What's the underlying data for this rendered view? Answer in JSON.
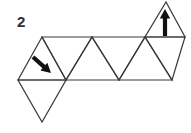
{
  "figure": {
    "label": "2",
    "kind": "triangle-net-diagram",
    "background_color": "#ffffff",
    "line_color": "#3a3a3a",
    "arrow_color": "#111111",
    "label_color": "#2f2f2f",
    "canvas": {
      "width": 191,
      "height": 133
    },
    "geometry": {
      "top_row_y": 37,
      "bottom_row_y": 80,
      "top_vertices_x": [
        42,
        92,
        145,
        185
      ],
      "bottom_vertices_x": [
        18,
        66,
        119,
        172
      ],
      "upper_tab_apex": {
        "x": 166,
        "y": 2
      },
      "lower_tab_apex": {
        "x": 42,
        "y": 122
      }
    },
    "triangles": [
      {
        "name": "strip-up-1",
        "points": "18,80 66,80 42,37"
      },
      {
        "name": "strip-down-1",
        "points": "42,37 92,37 66,80"
      },
      {
        "name": "strip-up-2",
        "points": "66,80 119,80 92,37"
      },
      {
        "name": "strip-down-2",
        "points": "92,37 145,37 119,80"
      },
      {
        "name": "strip-up-3",
        "points": "119,80 172,80 145,37"
      },
      {
        "name": "strip-down-3",
        "points": "145,37 185,37 172,80"
      },
      {
        "name": "upper-tab-triangle",
        "points": "145,37 185,37 166,2"
      },
      {
        "name": "lower-tab-triangle",
        "points": "18,80 66,80 42,122"
      }
    ],
    "arrows": [
      {
        "name": "down-right-arrow",
        "direction": "down-right",
        "in_triangle": "strip-up-1",
        "tail": {
          "x": 33,
          "y": 57
        },
        "head": {
          "x": 51,
          "y": 73
        }
      },
      {
        "name": "up-arrow",
        "direction": "up",
        "in_triangle": "upper-tab-triangle",
        "tail": {
          "x": 165,
          "y": 36
        },
        "head": {
          "x": 165,
          "y": 9
        }
      }
    ]
  }
}
